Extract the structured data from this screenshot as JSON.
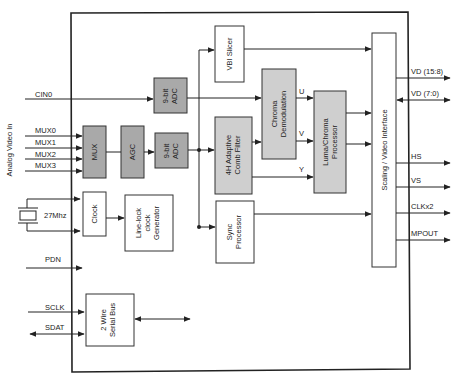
{
  "diagram": {
    "side_label": "Analog Video In",
    "inputs": {
      "cin0": "CIN0",
      "mux": [
        "MUX0",
        "MUX1",
        "MUX2",
        "MUX3"
      ],
      "crystal": "27Mhz",
      "pdn": "PDN",
      "sclk": "SCLK",
      "sdat": "SDAT"
    },
    "blocks": {
      "mux": "MUX",
      "agc": "AGC",
      "adc_top": [
        "9-bit",
        "ADC"
      ],
      "adc_bottom": [
        "9-bit",
        "ADC"
      ],
      "vbi": "VBI Slicer",
      "chroma": [
        "Chroma",
        "Demodulation"
      ],
      "comb": [
        "4H Adaptive",
        "Comb Filter"
      ],
      "luma": [
        "Luma/Chroma",
        "Processor"
      ],
      "sync": [
        "Sync",
        "Processor"
      ],
      "scaling": "Scaling / Video Interface",
      "clock": "Clock",
      "linelock": [
        "Line-lock",
        "clock",
        "Generator"
      ],
      "serial": [
        "2 Wire",
        "Serial Bus"
      ]
    },
    "signals": {
      "u": "U",
      "v": "V",
      "y": "Y"
    },
    "outputs": [
      "VD (15:8)",
      "VD (7:0)",
      "HS",
      "VS",
      "CLKx2",
      "MPOUT"
    ]
  }
}
